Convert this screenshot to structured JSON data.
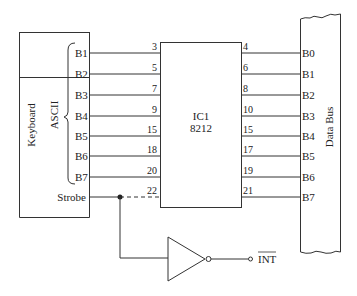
{
  "diagram": {
    "keyboard": {
      "title": "Keyboard",
      "group_label": "ASCII",
      "outputs": [
        "B1",
        "B2",
        "B3",
        "B4",
        "B5",
        "B6",
        "B7"
      ],
      "strobe": "Strobe"
    },
    "ic": {
      "name": "IC1",
      "part": "8212",
      "input_pins": [
        "3",
        "5",
        "7",
        "9",
        "15",
        "18",
        "20",
        "22"
      ],
      "output_pins": [
        "4",
        "6",
        "8",
        "10",
        "15",
        "17",
        "19",
        "21"
      ]
    },
    "data_bus": {
      "title": "Data Bus",
      "lines": [
        "B0",
        "B1",
        "B2",
        "B3",
        "B4",
        "B5",
        "B6",
        "B7"
      ]
    },
    "inverter": {
      "output_label": "INT"
    }
  }
}
